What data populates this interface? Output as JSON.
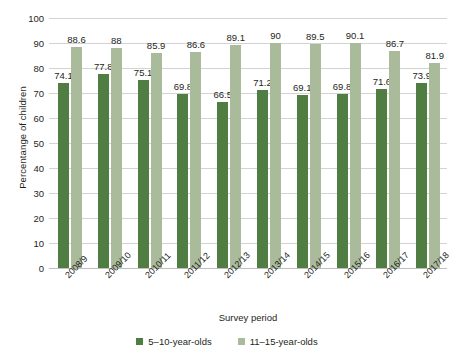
{
  "chart_data": {
    "type": "bar",
    "title": "",
    "xlabel": "Survey period",
    "ylabel": "Percentange of children",
    "ylim": [
      0,
      100
    ],
    "ytick_step": 10,
    "yticks": [
      "100",
      "90",
      "80",
      "70",
      "60",
      "50",
      "40",
      "30",
      "20",
      "10",
      "0"
    ],
    "grid": true,
    "legend_position": "bottom",
    "categories": [
      "2008/9",
      "2009/10",
      "2010/11",
      "2011/12",
      "2012/13",
      "2013/14",
      "2014/15",
      "2015/16",
      "2016/17",
      "2017/18"
    ],
    "series": [
      {
        "name": "5–10-year-olds",
        "color": "#4f7d42",
        "values": [
          74.1,
          77.8,
          75.1,
          69.8,
          66.5,
          71.2,
          69.1,
          69.8,
          71.6,
          73.9
        ],
        "labels": [
          "74.1",
          "77.8",
          "75.1",
          "69.8",
          "66.5",
          "71.2",
          "69.1",
          "69.8",
          "71.6",
          "73.9"
        ]
      },
      {
        "name": "11–15-year-olds",
        "color": "#a9bb9b",
        "values": [
          88.6,
          88.0,
          85.9,
          86.6,
          89.1,
          90.0,
          89.5,
          90.1,
          86.7,
          81.9
        ],
        "labels": [
          "88.6",
          "88",
          "85.9",
          "86.6",
          "89.1",
          "90",
          "89.5",
          "90.1",
          "86.7",
          "81.9"
        ]
      }
    ]
  },
  "colors": {
    "series_dark_green": "#4f7d42",
    "series_light_green": "#a9bb9b",
    "gridline": "#d3d3d3",
    "text": "#231f20",
    "background": "#ffffff"
  }
}
